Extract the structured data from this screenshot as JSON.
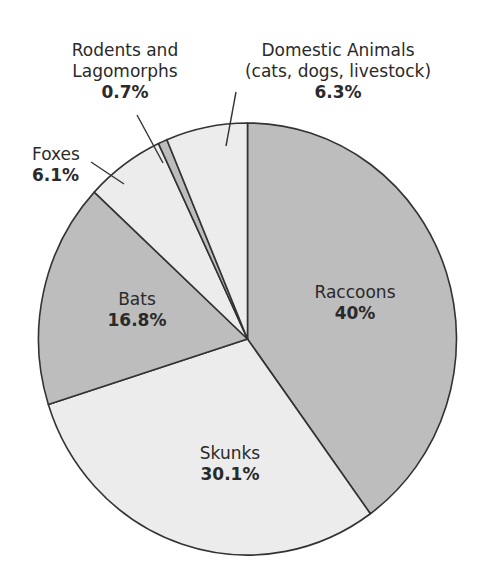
{
  "chart_data": {
    "type": "pie",
    "title": "",
    "start_angle_deg": 0,
    "direction": "clockwise",
    "slices": [
      {
        "label": "Raccoons",
        "value": 40,
        "display": "40%",
        "color": "#bdbdbd"
      },
      {
        "label": "Skunks",
        "value": 30.1,
        "display": "30.1%",
        "color": "#ececec"
      },
      {
        "label": "Bats",
        "value": 16.8,
        "display": "16.8%",
        "color": "#bdbdbd"
      },
      {
        "label": "Foxes",
        "value": 6.1,
        "display": "6.1%",
        "color": "#ececec"
      },
      {
        "label": "Rodents and Lagomorphs",
        "value": 0.7,
        "display": "0.7%",
        "color": "#bdbdbd"
      },
      {
        "label": "Domestic Animals (cats, dogs, livestock)",
        "value": 6.3,
        "display": "6.3%",
        "color": "#ececec"
      }
    ]
  },
  "labels": {
    "raccoons": {
      "name": "Raccoons",
      "pct": "40%"
    },
    "skunks": {
      "name": "Skunks",
      "pct": "30.1%"
    },
    "bats": {
      "name": "Bats",
      "pct": "16.8%"
    },
    "foxes": {
      "name": "Foxes",
      "pct": "6.1%"
    },
    "rodents": {
      "line1": "Rodents and",
      "line2": "Lagomorphs",
      "pct": "0.7%"
    },
    "domestic": {
      "line1": "Domestic Animals",
      "line2": "(cats, dogs, livestock)",
      "pct": "6.3%"
    }
  },
  "colors": {
    "dark": "#bdbdbd",
    "light": "#ececec",
    "stroke": "#333333"
  }
}
